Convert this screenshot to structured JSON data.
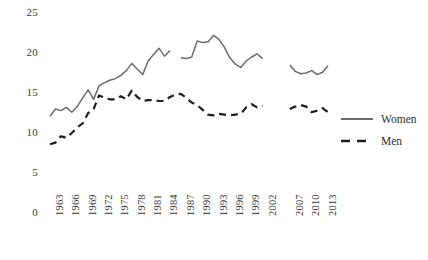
{
  "chart_data": {
    "type": "line",
    "title": "",
    "xlabel": "",
    "ylabel": "",
    "ylim": [
      0,
      25
    ],
    "yticks": [
      0,
      5,
      10,
      15,
      20,
      25
    ],
    "grid": false,
    "legend_position": "right",
    "x_tick_labels": [
      "1963",
      "1966",
      "1969",
      "1972",
      "1975",
      "1978",
      "1981",
      "1984",
      "1987",
      "1990",
      "1993",
      "1996",
      "1999",
      "2002",
      "2007",
      "2010",
      "2013"
    ],
    "x_tick_years": [
      1963,
      1966,
      1969,
      1972,
      1975,
      1978,
      1981,
      1984,
      1987,
      1990,
      1993,
      1996,
      1999,
      2002,
      2007,
      2010,
      2013
    ],
    "x_range": [
      1963,
      2014
    ],
    "x_gap_years": [
      2003,
      2004,
      2005,
      2006
    ],
    "series": [
      {
        "name": "Women",
        "style": "solid",
        "color": "#6b6b6b",
        "x": [
          1963,
          1964,
          1965,
          1966,
          1967,
          1968,
          1969,
          1970,
          1971,
          1972,
          1973,
          1974,
          1975,
          1976,
          1977,
          1978,
          1979,
          1980,
          1981,
          1982,
          1983,
          1984,
          1985,
          1987,
          1988,
          1989,
          1990,
          1991,
          1992,
          1993,
          1994,
          1995,
          1996,
          1997,
          1998,
          1999,
          2000,
          2001,
          2002,
          2007,
          2008,
          2009,
          2010,
          2011,
          2012,
          2013,
          2014
        ],
        "values": [
          12.1,
          13.0,
          12.8,
          13.2,
          12.6,
          13.3,
          14.4,
          15.4,
          14.2,
          15.9,
          16.3,
          16.6,
          16.8,
          17.2,
          17.8,
          18.7,
          18.0,
          17.3,
          19.0,
          19.8,
          20.6,
          19.6,
          20.3,
          19.4,
          19.3,
          19.5,
          21.5,
          21.3,
          21.4,
          22.2,
          21.7,
          20.7,
          19.4,
          18.6,
          18.2,
          19.0,
          19.5,
          19.9,
          19.3,
          18.5,
          17.7,
          17.4,
          17.5,
          17.8,
          17.3,
          17.6,
          18.4
        ]
      },
      {
        "name": "Men",
        "style": "dashed",
        "color": "#1e1e1e",
        "x": [
          1963,
          1964,
          1965,
          1966,
          1967,
          1968,
          1969,
          1970,
          1971,
          1972,
          1973,
          1974,
          1975,
          1976,
          1977,
          1978,
          1979,
          1980,
          1981,
          1982,
          1983,
          1984,
          1985,
          1986,
          1987,
          1988,
          1989,
          1990,
          1991,
          1992,
          1993,
          1994,
          1995,
          1996,
          1997,
          1998,
          1999,
          2000,
          2001,
          2002,
          2007,
          2008,
          2009,
          2010,
          2011,
          2012,
          2013,
          2014
        ],
        "values": [
          8.6,
          8.8,
          9.6,
          9.4,
          10.0,
          10.7,
          11.2,
          12.5,
          13.0,
          14.7,
          14.4,
          14.2,
          14.2,
          14.6,
          14.2,
          15.3,
          14.5,
          14.0,
          14.1,
          14.1,
          14.0,
          14.0,
          14.5,
          14.8,
          14.9,
          14.4,
          13.8,
          13.5,
          12.9,
          12.3,
          12.2,
          12.4,
          12.3,
          12.2,
          12.3,
          12.4,
          13.2,
          13.6,
          13.2,
          13.4,
          13.0,
          13.3,
          13.5,
          13.3,
          12.6,
          12.8,
          13.1,
          12.6
        ]
      }
    ],
    "legend": [
      {
        "label": "Women",
        "style": "solid",
        "color": "#6b6b6b"
      },
      {
        "label": "Men",
        "style": "dashed",
        "color": "#1e1e1e"
      }
    ]
  }
}
